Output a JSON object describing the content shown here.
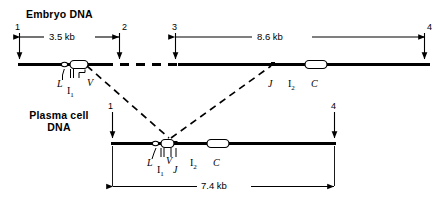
{
  "figure": {
    "kind": "gene-rearrangement-diagram",
    "rows": [
      {
        "id": "embryo",
        "title": "Embryo DNA",
        "title_lines": [
          "Embryo DNA"
        ],
        "markers": [
          "1",
          "2",
          "3",
          "4"
        ],
        "measurements": [
          "3.5 kb",
          "8.6 kb"
        ],
        "gene_labels": [
          "L",
          "I1",
          "V",
          "J",
          "I2",
          "C"
        ]
      },
      {
        "id": "plasma",
        "title": "Plasma cell DNA",
        "title_lines": [
          "Plasma cell",
          "DNA"
        ],
        "markers": [
          "1",
          "4"
        ],
        "measurements": [
          "7.4 kb"
        ],
        "gene_labels": [
          "L",
          "I1",
          "V",
          "J",
          "I2",
          "C"
        ]
      }
    ]
  },
  "embryo": {
    "title_line1": "Embryo DNA",
    "marker_1": "1",
    "marker_2": "2",
    "marker_3": "3",
    "marker_4": "4",
    "dist_1_2": "3.5 kb",
    "dist_3_4": "8.6 kb",
    "gene_L": "L",
    "gene_I1_base": "I",
    "gene_I1_sub": "1",
    "gene_V": "V",
    "gene_J": "J",
    "gene_I2_base": "I",
    "gene_I2_sub": "2",
    "gene_C": "C"
  },
  "plasma": {
    "title_line1": "Plasma cell",
    "title_line2": "DNA",
    "marker_1": "1",
    "marker_4": "4",
    "dist_1_4": "7.4 kb",
    "gene_L": "L",
    "gene_I1_base": "I",
    "gene_I1_sub": "1",
    "gene_V": "V",
    "gene_J": "J",
    "gene_I2_base": "I",
    "gene_I2_sub": "2",
    "gene_C": "C"
  },
  "colors": {
    "ink": "#000000",
    "paper": "#ffffff"
  }
}
